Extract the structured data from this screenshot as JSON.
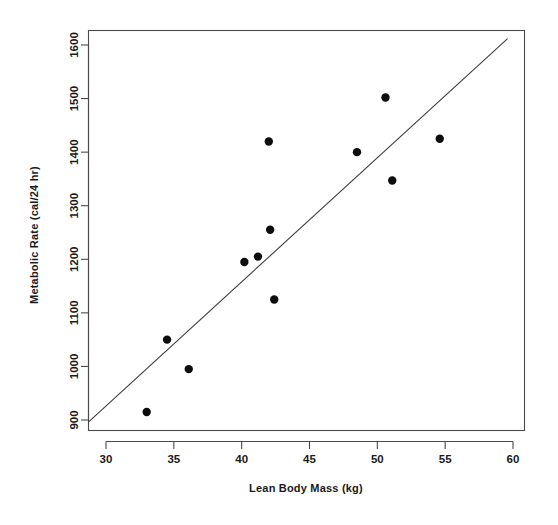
{
  "chart_data": {
    "type": "scatter",
    "title": "",
    "xlabel": "Lean Body Mass (kg)",
    "ylabel": "Metabolic Rate (cal/24 hr)",
    "xlim": [
      28.7,
      60.6
    ],
    "ylim": [
      880,
      1625
    ],
    "grid": false,
    "legend": null,
    "xticks": [
      30,
      35,
      40,
      45,
      50,
      55,
      60
    ],
    "xtick_labels": [
      "30",
      "35",
      "40",
      "45",
      "50",
      "55",
      "60"
    ],
    "yticks": [
      900,
      1000,
      1100,
      1200,
      1300,
      1400,
      1500,
      1600
    ],
    "ytick_labels": [
      "900",
      "1000",
      "1100",
      "1200",
      "1300",
      "1400",
      "1500",
      "1600"
    ],
    "x": [
      33.0,
      34.5,
      36.1,
      40.2,
      41.2,
      42.0,
      42.1,
      42.4,
      48.5,
      50.6,
      51.1,
      54.6
    ],
    "y": [
      915,
      1050,
      995,
      1195,
      1205,
      1420,
      1255,
      1125,
      1400,
      1502,
      1347,
      1425
    ],
    "points": [
      {
        "x": 33.0,
        "y": 915
      },
      {
        "x": 34.5,
        "y": 1050
      },
      {
        "x": 36.1,
        "y": 995
      },
      {
        "x": 40.2,
        "y": 1195
      },
      {
        "x": 41.2,
        "y": 1205
      },
      {
        "x": 42.0,
        "y": 1420
      },
      {
        "x": 42.1,
        "y": 1255
      },
      {
        "x": 42.4,
        "y": 1125
      },
      {
        "x": 48.5,
        "y": 1400
      },
      {
        "x": 50.6,
        "y": 1502
      },
      {
        "x": 51.1,
        "y": 1347
      },
      {
        "x": 54.6,
        "y": 1425
      }
    ],
    "fit_line": {
      "type": "linear-regression",
      "x_start": 28.7,
      "y_start": 896,
      "x_end": 59.6,
      "y_end": 1612
    },
    "marker": {
      "shape": "filled-circle",
      "color": "#0d0d0d",
      "radius_px": 4.2
    },
    "line_color": "#3d3d3d",
    "axis_color": "#4a4a4a",
    "background": "#ffffff"
  }
}
